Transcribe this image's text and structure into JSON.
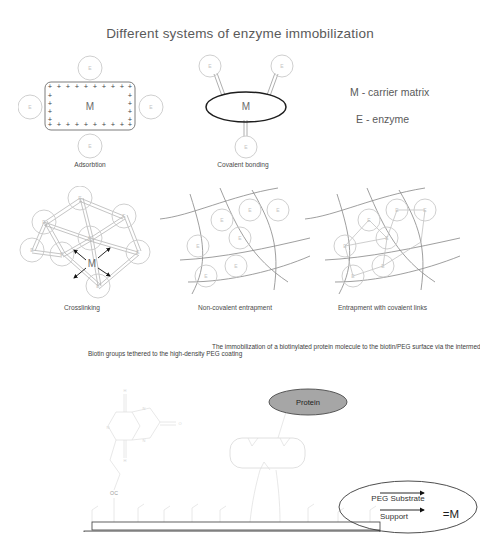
{
  "figure": {
    "title": "Different systems of enzyme immobilization",
    "legend": {
      "matrix": "M - carrier matrix",
      "enzyme": "E - enzyme"
    },
    "symbols": {
      "matrix_letter": "M",
      "enzyme_letter": "E",
      "plus_sign": "+",
      "equals_matrix": "=M"
    },
    "panels": [
      {
        "id": "adsorbtion",
        "caption": "Adsorbtion",
        "matrix_label": "M",
        "enzyme_count": 4,
        "charge_symbol": "+"
      },
      {
        "id": "covalent-bonding",
        "caption": "Covalent bonding",
        "matrix_label": "M",
        "enzyme_count": 3
      },
      {
        "id": "crosslinking",
        "caption": "Crosslinking",
        "matrix_label": "M",
        "enzyme_count": 8
      },
      {
        "id": "non-covalent-entrapment",
        "caption": "Non-covalent entrapment",
        "enzyme_count": 7
      },
      {
        "id": "entrapment-with-covalent-links",
        "caption": "Entrapment with covalent links",
        "enzyme_count": 7
      }
    ],
    "bottom": {
      "note_biotin": "Biotin groups tethered to the high-density PEG coating",
      "note_immobilization": "The immobilization of a biotinylated protein molecule to the biotin/PEG surface via the intermediate streptavidin.",
      "protein_label": "Protein",
      "biotin_oc_label": "OC",
      "substrate": {
        "line1": "PEG Substrate",
        "line2": "Support",
        "equals": "=M"
      }
    },
    "colors": {
      "background": "#ffffff",
      "title_text": "#5a5a5a",
      "body_text": "#3d3d3d",
      "enzyme_outline": "#c9c9c9",
      "mesh_line": "#8e8e8e",
      "protein_fill": "#a6a6a6",
      "support_fill": "#e2e2e2"
    }
  }
}
